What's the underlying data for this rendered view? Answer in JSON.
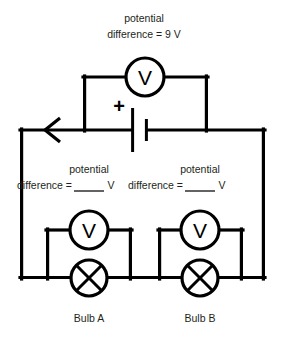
{
  "diagram": {
    "type": "circuit-schematic",
    "title_label": {
      "line1": "potential",
      "line2": "difference = 9 V",
      "value": "9 V"
    },
    "source": {
      "name": "battery",
      "polarity_label": "+",
      "voltage": "9 V"
    },
    "current_arrow": {
      "name": "current-direction-arrow",
      "direction": "left"
    },
    "main_meter": {
      "name": "voltmeter-source",
      "glyph": "V",
      "reading": "9 V"
    },
    "branches": [
      {
        "id": "branch-a",
        "bulb_label": "Bulb A",
        "meter_glyph": "V",
        "label_line1": "potential",
        "label_line2_prefix": "difference =",
        "label_line2_suffix": "V",
        "answer_blank": ""
      },
      {
        "id": "branch-b",
        "bulb_label": "Bulb B",
        "meter_glyph": "V",
        "label_line1": "potential",
        "label_line2_prefix": "difference =",
        "label_line2_suffix": "V",
        "answer_blank": ""
      }
    ],
    "colors": {
      "wire": "#000000",
      "text": "#231f20",
      "background": "#ffffff"
    }
  }
}
